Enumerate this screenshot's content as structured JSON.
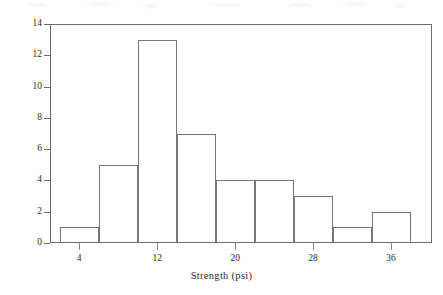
{
  "figure": {
    "background_color": "#ffffff",
    "line_color": "#6d6d6d",
    "bar_edge_color": "#777777",
    "text_color": "#2b2b2b"
  },
  "chart_data": {
    "type": "bar",
    "chart_subtype": "histogram",
    "title": "",
    "xlabel": "Strength (psi)",
    "ylabel": "Frequency",
    "xlim": [
      1.0,
      40.2
    ],
    "ylim": [
      0,
      14
    ],
    "grid": false,
    "legend": null,
    "bin_width": 4,
    "bin_edges": [
      2,
      6,
      10,
      14,
      18,
      22,
      26,
      30,
      34,
      38
    ],
    "categories": [
      "2-6",
      "6-10",
      "10-14",
      "14-18",
      "18-22",
      "22-26",
      "26-30",
      "30-34",
      "34-38"
    ],
    "values": [
      1,
      5,
      13,
      7,
      4,
      4,
      3,
      1,
      2
    ],
    "total_count": 40,
    "x_ticks": [
      {
        "value": 4,
        "label": "4"
      },
      {
        "value": 12,
        "label": "12"
      },
      {
        "value": 20,
        "label": "20"
      },
      {
        "value": 28,
        "label": "28"
      },
      {
        "value": 36,
        "label": "36"
      }
    ],
    "y_ticks": [
      {
        "value": 0,
        "label": "0"
      },
      {
        "value": 2,
        "label": "2"
      },
      {
        "value": 4,
        "label": "4"
      },
      {
        "value": 6,
        "label": "6"
      },
      {
        "value": 8,
        "label": "8"
      },
      {
        "value": 10,
        "label": "10"
      },
      {
        "value": 12,
        "label": "12"
      },
      {
        "value": 14,
        "label": "14"
      }
    ]
  }
}
